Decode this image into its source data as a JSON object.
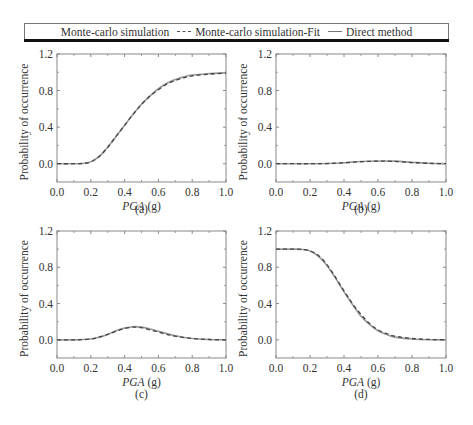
{
  "legend": {
    "items": [
      {
        "label": "Monte-carlo simulation",
        "symbol": "none"
      },
      {
        "label": "Monte-carlo simulation-Fit",
        "symbol": "dashed"
      },
      {
        "label": "Direct method",
        "symbol": "solid"
      }
    ]
  },
  "colors": {
    "solid_line": "#9a9a9a",
    "dashed_line": "#444444",
    "frame": "#888888",
    "text": "#333333"
  },
  "chart_data": [
    {
      "type": "line",
      "panel": "(a)",
      "xlabel": "PGA (g)",
      "ylabel": "Probability of occurrence",
      "xlim": [
        0.0,
        1.0
      ],
      "ylim": [
        -0.2,
        1.2
      ],
      "xticks": [
        "0.0",
        "0.2",
        "0.4",
        "0.6",
        "0.8",
        "1.0"
      ],
      "yticks": [
        "0.0",
        "0.4",
        "0.8",
        "1.2"
      ],
      "x": [
        0.0,
        0.1,
        0.15,
        0.2,
        0.25,
        0.3,
        0.35,
        0.4,
        0.45,
        0.5,
        0.55,
        0.6,
        0.65,
        0.7,
        0.75,
        0.8,
        0.9,
        1.0
      ],
      "series": [
        {
          "name": "Direct method",
          "values": [
            0.0,
            0.0,
            0.003,
            0.02,
            0.08,
            0.18,
            0.3,
            0.42,
            0.54,
            0.65,
            0.74,
            0.82,
            0.88,
            0.92,
            0.95,
            0.97,
            0.985,
            0.995
          ]
        },
        {
          "name": "Monte-carlo simulation-Fit",
          "values": [
            0.0,
            0.0,
            0.003,
            0.02,
            0.08,
            0.18,
            0.3,
            0.42,
            0.54,
            0.65,
            0.74,
            0.81,
            0.87,
            0.91,
            0.94,
            0.96,
            0.98,
            0.99
          ]
        }
      ]
    },
    {
      "type": "line",
      "panel": "(b)",
      "xlabel": "PGA (g)",
      "ylabel": "Probability of occurrence",
      "xlim": [
        0.0,
        1.0
      ],
      "ylim": [
        -0.2,
        1.2
      ],
      "xticks": [
        "0.0",
        "0.2",
        "0.4",
        "0.6",
        "0.8",
        "1.0"
      ],
      "yticks": [
        "0.0",
        "0.4",
        "0.8",
        "1.2"
      ],
      "x": [
        0.0,
        0.1,
        0.2,
        0.3,
        0.4,
        0.5,
        0.6,
        0.7,
        0.8,
        0.9,
        1.0
      ],
      "series": [
        {
          "name": "Direct method",
          "values": [
            0.0,
            0.0,
            0.0,
            0.002,
            0.01,
            0.025,
            0.03,
            0.028,
            0.015,
            0.005,
            0.0
          ]
        },
        {
          "name": "Monte-carlo simulation-Fit",
          "values": [
            0.0,
            0.0,
            0.0,
            0.002,
            0.01,
            0.022,
            0.028,
            0.025,
            0.013,
            0.004,
            0.0
          ]
        }
      ]
    },
    {
      "type": "line",
      "panel": "(c)",
      "xlabel": "PGA (g)",
      "ylabel": "Probability of occurrence",
      "xlim": [
        0.0,
        1.0
      ],
      "ylim": [
        -0.2,
        1.2
      ],
      "xticks": [
        "0.0",
        "0.2",
        "0.4",
        "0.6",
        "0.8",
        "1.0"
      ],
      "yticks": [
        "0.0",
        "0.4",
        "0.8",
        "1.2"
      ],
      "x": [
        0.0,
        0.1,
        0.2,
        0.25,
        0.3,
        0.35,
        0.4,
        0.45,
        0.5,
        0.55,
        0.6,
        0.65,
        0.7,
        0.8,
        0.9,
        1.0
      ],
      "series": [
        {
          "name": "Direct method",
          "values": [
            0.0,
            0.0,
            0.01,
            0.03,
            0.06,
            0.1,
            0.13,
            0.145,
            0.14,
            0.12,
            0.095,
            0.07,
            0.045,
            0.015,
            0.004,
            0.0
          ]
        },
        {
          "name": "Monte-carlo simulation-Fit",
          "values": [
            0.0,
            0.0,
            0.01,
            0.03,
            0.06,
            0.095,
            0.125,
            0.14,
            0.135,
            0.11,
            0.085,
            0.06,
            0.04,
            0.015,
            0.004,
            0.0
          ]
        }
      ]
    },
    {
      "type": "line",
      "panel": "(d)",
      "xlabel": "PGA (g)",
      "ylabel": "Probability of occurrence",
      "xlim": [
        0.0,
        1.0
      ],
      "ylim": [
        -0.2,
        1.2
      ],
      "xticks": [
        "0.0",
        "0.2",
        "0.4",
        "0.6",
        "0.8",
        "1.0"
      ],
      "yticks": [
        "0.0",
        "0.4",
        "0.8",
        "1.2"
      ],
      "x": [
        0.0,
        0.1,
        0.15,
        0.2,
        0.25,
        0.3,
        0.35,
        0.4,
        0.45,
        0.5,
        0.55,
        0.6,
        0.65,
        0.7,
        0.8,
        0.9,
        1.0
      ],
      "series": [
        {
          "name": "Direct method",
          "values": [
            1.0,
            1.0,
            0.997,
            0.98,
            0.92,
            0.82,
            0.68,
            0.53,
            0.39,
            0.26,
            0.17,
            0.1,
            0.06,
            0.03,
            0.01,
            0.002,
            0.0
          ]
        },
        {
          "name": "Monte-carlo simulation-Fit",
          "values": [
            1.0,
            1.0,
            0.997,
            0.98,
            0.93,
            0.83,
            0.69,
            0.54,
            0.4,
            0.28,
            0.18,
            0.11,
            0.07,
            0.04,
            0.015,
            0.005,
            0.0
          ]
        }
      ]
    }
  ]
}
